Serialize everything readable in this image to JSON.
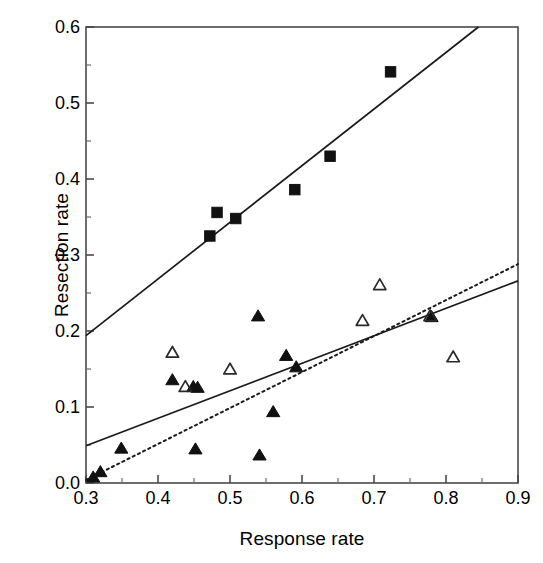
{
  "chart_data": {
    "type": "scatter",
    "title": "",
    "xlabel": "Response rate",
    "ylabel": "Resection rate",
    "xlim": [
      0.3,
      0.9
    ],
    "ylim": [
      0.0,
      0.6
    ],
    "xticks": [
      "0.3",
      "0.4",
      "0.5",
      "0.6",
      "0.7",
      "0.8",
      "0.9"
    ],
    "yticks": [
      "0.0",
      "0.1",
      "0.2",
      "0.3",
      "0.4",
      "0.5",
      "0.6"
    ],
    "xtick_values": [
      0.3,
      0.4,
      0.5,
      0.6,
      0.7,
      0.8,
      0.9
    ],
    "ytick_values": [
      0.0,
      0.1,
      0.2,
      0.3,
      0.4,
      0.5,
      0.6
    ],
    "grid": false,
    "legend": "none",
    "series": [
      {
        "name": "filled-square",
        "marker": "filled-square",
        "color": "#000000",
        "points": [
          [
            0.472,
            0.325
          ],
          [
            0.482,
            0.356
          ],
          [
            0.508,
            0.348
          ],
          [
            0.59,
            0.386
          ],
          [
            0.639,
            0.43
          ],
          [
            0.723,
            0.541
          ]
        ]
      },
      {
        "name": "filled-triangle",
        "marker": "filled-triangle",
        "color": "#000000",
        "points": [
          [
            0.31,
            0.008
          ],
          [
            0.32,
            0.015
          ],
          [
            0.349,
            0.046
          ],
          [
            0.42,
            0.136
          ],
          [
            0.449,
            0.127
          ],
          [
            0.455,
            0.126
          ],
          [
            0.452,
            0.045
          ],
          [
            0.539,
            0.22
          ],
          [
            0.541,
            0.037
          ],
          [
            0.56,
            0.094
          ],
          [
            0.578,
            0.168
          ],
          [
            0.592,
            0.153
          ],
          [
            0.78,
            0.219
          ]
        ]
      },
      {
        "name": "open-triangle",
        "marker": "open-triangle",
        "color": "#000000",
        "points": [
          [
            0.42,
            0.172
          ],
          [
            0.438,
            0.127
          ],
          [
            0.5,
            0.15
          ],
          [
            0.684,
            0.214
          ],
          [
            0.708,
            0.261
          ],
          [
            0.778,
            0.22
          ],
          [
            0.81,
            0.166
          ]
        ]
      }
    ],
    "trendlines": [
      {
        "name": "upper-solid-line",
        "style": "solid",
        "x0": 0.3,
        "y0": 0.194,
        "x1": 0.845,
        "y1": 0.6
      },
      {
        "name": "lower-solid-line",
        "style": "solid",
        "x0": 0.3,
        "y0": 0.049,
        "x1": 0.9,
        "y1": 0.266
      },
      {
        "name": "lower-dotted-line",
        "style": "dotted",
        "x0": 0.3,
        "y0": 0.004,
        "x1": 0.9,
        "y1": 0.288
      }
    ]
  },
  "axes": {
    "x_label": "Response rate",
    "y_label": "Resection rate"
  }
}
